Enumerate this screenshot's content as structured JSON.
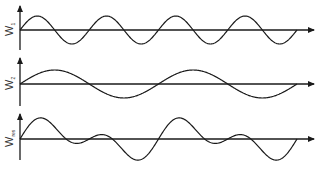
{
  "diagram": {
    "title": "",
    "panels": [
      {
        "label": "W",
        "subscript": "1",
        "axis_y": 30,
        "axis_top": 6,
        "axis_bottom": 50,
        "cycles": 4,
        "amplitude": 14,
        "kind": "single"
      },
      {
        "label": "W",
        "subscript": "2",
        "axis_y": 84,
        "axis_top": 58,
        "axis_bottom": 106,
        "cycles": 2,
        "amplitude": 14,
        "kind": "single"
      },
      {
        "label": "W",
        "subscript": "res",
        "axis_y": 139,
        "axis_top": 114,
        "axis_bottom": 160,
        "cycles": [
          4,
          2
        ],
        "amplitude": 12,
        "kind": "sum"
      }
    ],
    "x_start": 20,
    "x_wave_end": 297,
    "x_arrow_end": 314,
    "colors": {
      "stroke": "#1a1a1a",
      "background": "#ffffff"
    }
  }
}
